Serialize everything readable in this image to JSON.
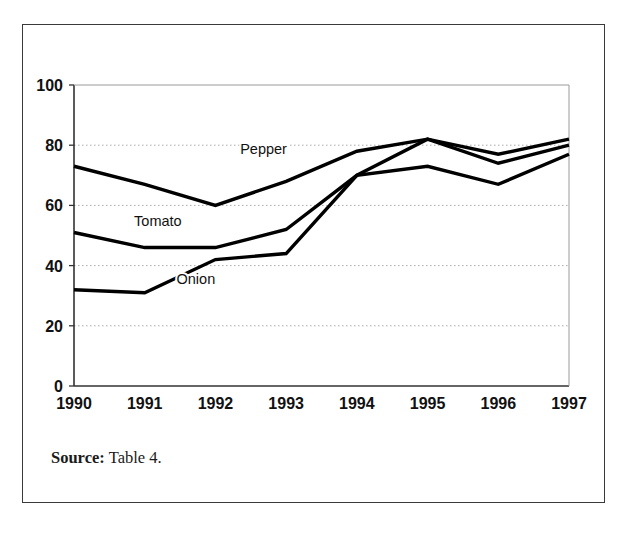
{
  "figure": {
    "source_lead": "Source:",
    "source_reference": "Table 4."
  },
  "chart_data": {
    "type": "line",
    "title": "",
    "subtitle": "",
    "xlabel": "",
    "ylabel": "",
    "categories": [
      "1990",
      "1991",
      "1992",
      "1993",
      "1994",
      "1995",
      "1996",
      "1997"
    ],
    "x_tick_labels": [
      "1990",
      "1991",
      "1992",
      "1993",
      "1994",
      "1995",
      "1996",
      "1997"
    ],
    "y_tick_labels": [
      "0",
      "20",
      "40",
      "60",
      "80",
      "100"
    ],
    "y_ticks": [
      0,
      20,
      40,
      60,
      80,
      100
    ],
    "ylim": [
      0,
      100
    ],
    "grid": "horizontal-dotted",
    "legend_position": "inline-annotations",
    "line_color": "#000000",
    "grid_color": "#aaaaaa",
    "axis_color": "#555555",
    "series": [
      {
        "name": "Pepper",
        "label": "Pepper",
        "values": [
          73,
          67,
          60,
          68,
          78,
          82,
          77,
          82
        ],
        "annotation_x": 1992.35,
        "annotation_y": 77
      },
      {
        "name": "Tomato",
        "label": "Tomato",
        "values": [
          51,
          46,
          46,
          52,
          70,
          82,
          74,
          80
        ],
        "annotation_x": 1990.85,
        "annotation_y": 53
      },
      {
        "name": "Onion",
        "label": "Onion",
        "values": [
          32,
          31,
          42,
          44,
          70,
          73,
          67,
          77
        ],
        "annotation_x": 1991.45,
        "annotation_y": 34
      }
    ]
  }
}
